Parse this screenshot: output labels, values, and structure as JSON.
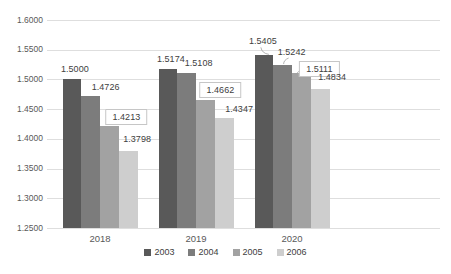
{
  "chart_data": {
    "type": "bar",
    "title": "",
    "categories": [
      "2018",
      "2019",
      "2020"
    ],
    "series": [
      {
        "name": "2003",
        "color": "#595959",
        "values": [
          1.5,
          1.5174,
          1.5405
        ]
      },
      {
        "name": "2004",
        "color": "#7c7c7c",
        "values": [
          1.4726,
          1.5108,
          1.5242
        ]
      },
      {
        "name": "2005",
        "color": "#a2a2a2",
        "values": [
          1.4213,
          1.4662,
          1.5111
        ]
      },
      {
        "name": "2006",
        "color": "#cecece",
        "values": [
          1.3798,
          1.4347,
          1.4834
        ]
      }
    ],
    "data_labels": {
      "2018": [
        "1.5000",
        "1.4726",
        "1.4213",
        "1.3798"
      ],
      "2019": [
        "1.5174",
        "1.5108",
        "1.4662",
        "1.4347"
      ],
      "2020": [
        "1.5405",
        "1.5242",
        "1.5111",
        "1.4834"
      ]
    },
    "boxed_labels": [
      "1.4213",
      "1.4662",
      "1.5111"
    ],
    "y_ticks": [
      "1.6000",
      "1.5500",
      "1.5000",
      "1.4500",
      "1.4000",
      "1.3500",
      "1.3000",
      "1.2500"
    ],
    "ylim": [
      1.25,
      1.6
    ],
    "grid": true,
    "legend_position": "bottom",
    "colors": {
      "axis_text": "#595959",
      "label_text": "#404040",
      "gridline": "#dedede",
      "label_box_border": "#c6c6c6",
      "leader_line": "#a0a0a0",
      "background": "#ffffff"
    }
  },
  "legend": {
    "items": [
      {
        "label": "2003"
      },
      {
        "label": "2004"
      },
      {
        "label": "2005"
      },
      {
        "label": "2006"
      }
    ]
  }
}
